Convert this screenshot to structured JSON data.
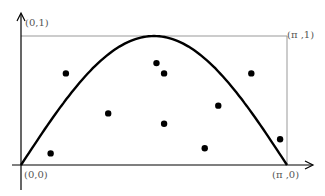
{
  "diagram": {
    "title": "",
    "labels": {
      "top_left": "(0,1)",
      "top_right": "(π ,1)",
      "bottom_left": "(0,0)",
      "bottom_right": "(π ,0)"
    },
    "curve": "y = sin(x), 0 ≤ x ≤ π",
    "rectangle": "[0, π] × [0, 1]",
    "points_count": 10,
    "colors": {
      "curve": "#000000",
      "box": "#999999",
      "points": "#000000"
    }
  },
  "chart_data": {
    "type": "scatter",
    "title": "",
    "xlabel": "",
    "ylabel": "",
    "xlim": [
      0,
      3.1416
    ],
    "ylim": [
      0,
      1
    ],
    "curve": {
      "name": "sin(x)",
      "x_range": [
        0,
        3.1416
      ]
    },
    "points": [
      {
        "x": 0.35,
        "y": 0.09
      },
      {
        "x": 0.53,
        "y": 0.71
      },
      {
        "x": 1.03,
        "y": 0.4
      },
      {
        "x": 1.6,
        "y": 0.79
      },
      {
        "x": 1.69,
        "y": 0.71
      },
      {
        "x": 1.69,
        "y": 0.32
      },
      {
        "x": 2.33,
        "y": 0.46
      },
      {
        "x": 2.17,
        "y": 0.13
      },
      {
        "x": 2.72,
        "y": 0.71
      },
      {
        "x": 3.06,
        "y": 0.2
      }
    ],
    "annotations": [
      "(0,1)",
      "(π ,1)",
      "(0,0)",
      "(π ,0)"
    ],
    "grid": false
  }
}
